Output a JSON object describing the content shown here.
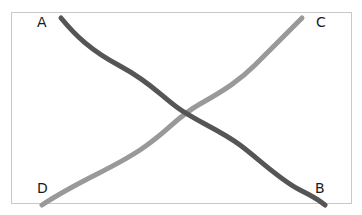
{
  "diagram": {
    "labels": {
      "a": "A",
      "b": "B",
      "c": "C",
      "d": "D"
    },
    "lines": [
      {
        "name": "A-B",
        "from": "A",
        "to": "B",
        "color": "#555555"
      },
      {
        "name": "D-C",
        "from": "D",
        "to": "C",
        "color": "#999999"
      }
    ],
    "frame_color": "#c8c8c8"
  }
}
